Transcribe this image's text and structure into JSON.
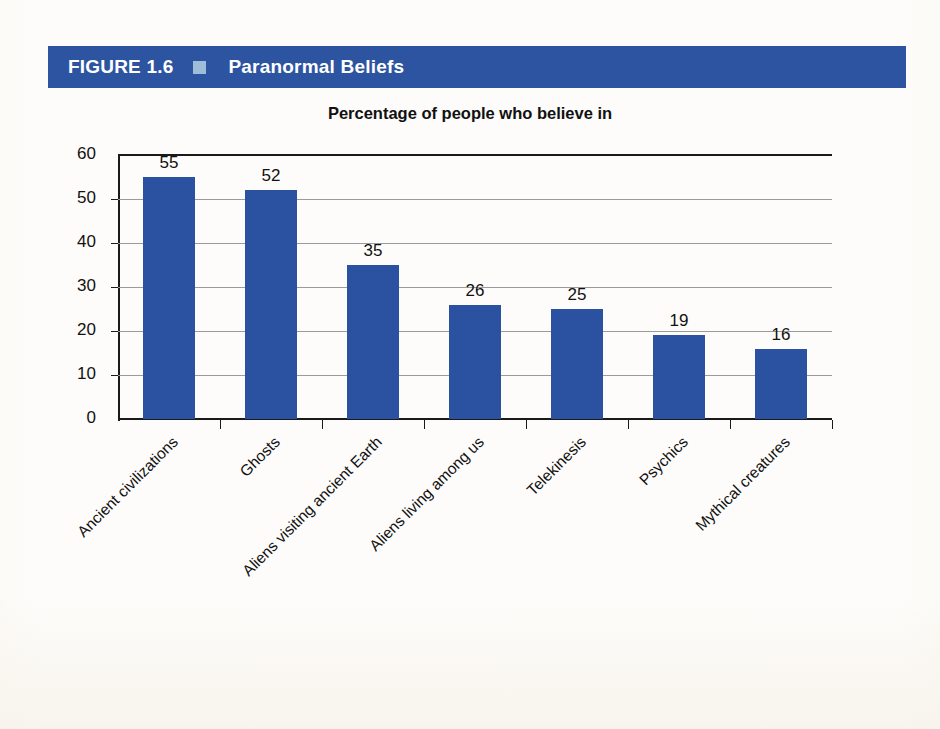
{
  "banner": {
    "figure_label": "FIGURE 1.6",
    "separator_icon": "square-bullet-icon",
    "title": "Paranormal Beliefs",
    "background_color": "#2d54a1",
    "square_color": "#9fbcd8"
  },
  "chart_data": {
    "type": "bar",
    "title": "Percentage of people who believe in",
    "subtitle": "",
    "xlabel": "",
    "ylabel": "",
    "ylim": [
      0,
      60
    ],
    "yticks": [
      0,
      10,
      20,
      30,
      40,
      50,
      60
    ],
    "grid": true,
    "legend": "none",
    "bar_color": "#2b52a0",
    "categories": [
      "Ancient civilizations",
      "Ghosts",
      "Aliens visiting ancient Earth",
      "Aliens living among us",
      "Telekinesis",
      "Psychics",
      "Mythical creatures"
    ],
    "values": [
      55,
      52,
      35,
      26,
      25,
      19,
      16
    ],
    "data_labels": [
      "55",
      "52",
      "35",
      "26",
      "25",
      "19",
      "16"
    ],
    "tick_labels": [
      "0",
      "10",
      "20",
      "30",
      "40",
      "50",
      "60"
    ]
  }
}
